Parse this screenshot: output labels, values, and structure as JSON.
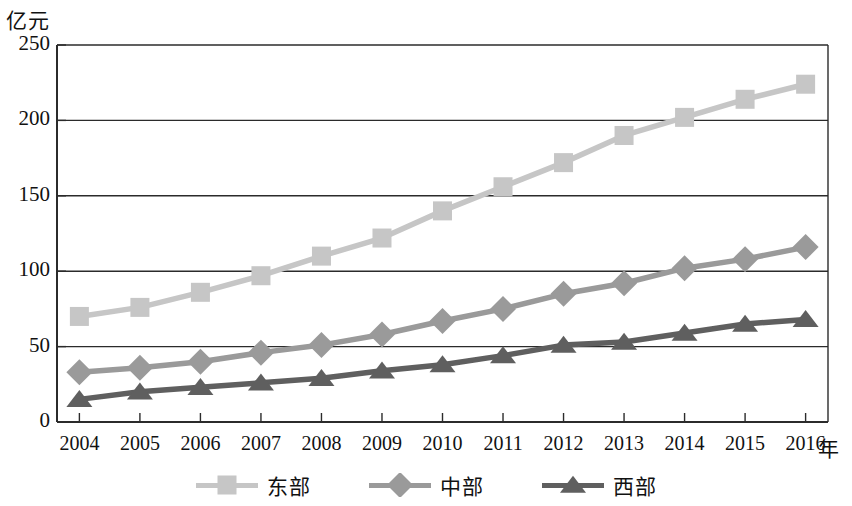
{
  "chart_data": {
    "type": "line",
    "title": "",
    "xlabel": "年",
    "ylabel": "亿元",
    "categories": [
      "2004",
      "2005",
      "2006",
      "2007",
      "2008",
      "2009",
      "2010",
      "2011",
      "2012",
      "2013",
      "2014",
      "2015",
      "2016"
    ],
    "ylim": [
      0,
      250
    ],
    "yticks": [
      0,
      50,
      100,
      150,
      200,
      250
    ],
    "ytick_labels": [
      "0",
      "50",
      "100",
      "150",
      "200",
      "250"
    ],
    "grid": "horizontal",
    "legend_position": "bottom-center",
    "series": [
      {
        "name": "东部",
        "marker": "square",
        "color": "#c6c6c6",
        "values": [
          70,
          76,
          86,
          97,
          110,
          122,
          140,
          156,
          172,
          190,
          202,
          214,
          224
        ]
      },
      {
        "name": "中部",
        "marker": "diamond",
        "color": "#9a9a9a",
        "values": [
          33,
          36,
          40,
          46,
          51,
          58,
          67,
          75,
          85,
          92,
          102,
          108,
          116
        ]
      },
      {
        "name": "西部",
        "marker": "triangle",
        "color": "#5f5f5f",
        "values": [
          15,
          20,
          23,
          26,
          29,
          34,
          38,
          44,
          51,
          53,
          59,
          65,
          68
        ]
      }
    ]
  },
  "axes": {
    "y_axis_title": "亿元",
    "x_axis_title": "年",
    "y_tick_labels": [
      "250",
      "200",
      "150",
      "100",
      "50",
      "0"
    ],
    "x_tick_labels": [
      "2004",
      "2005",
      "2006",
      "2007",
      "2008",
      "2009",
      "2010",
      "2011",
      "2012",
      "2013",
      "2014",
      "2015",
      "2016"
    ]
  },
  "legend": {
    "items": [
      {
        "label": "东部",
        "color": "#c6c6c6",
        "marker": "square-marker-icon"
      },
      {
        "label": "中部",
        "color": "#9a9a9a",
        "marker": "diamond-marker-icon"
      },
      {
        "label": "西部",
        "color": "#5f5f5f",
        "marker": "triangle-marker-icon"
      }
    ]
  },
  "colors": {
    "axis": "#2b2b2b",
    "grid": "#2b2b2b",
    "background": "#ffffff",
    "text": "#111111"
  }
}
